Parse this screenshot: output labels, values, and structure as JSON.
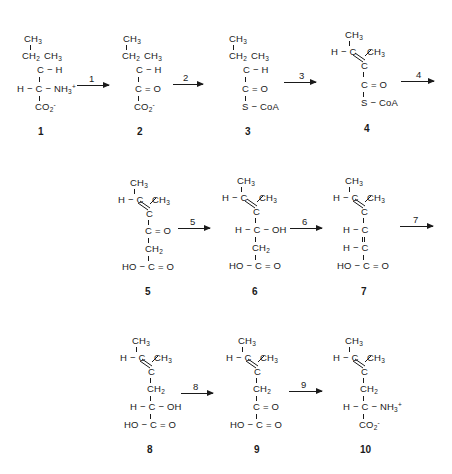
{
  "figure": {
    "type": "biochemical-pathway",
    "rows": 3,
    "compounds": [
      {
        "id": "1",
        "label": "1",
        "groups": [
          "CH3",
          "CH2",
          "CH3",
          "C-H",
          "H-C-NH3+",
          "CO2-"
        ]
      },
      {
        "id": "2",
        "label": "2",
        "groups": [
          "CH3",
          "CH2",
          "CH3",
          "C-H",
          "C=O",
          "CO2-"
        ]
      },
      {
        "id": "3",
        "label": "3",
        "groups": [
          "CH3",
          "CH2",
          "CH3",
          "C-H",
          "C=O",
          "S-CoA"
        ]
      },
      {
        "id": "4",
        "label": "4",
        "groups": [
          "CH3",
          "H-C",
          "CH3",
          "=C",
          "C=O",
          "S-CoA"
        ]
      },
      {
        "id": "5",
        "label": "5",
        "groups": [
          "CH3",
          "H-C",
          "CH3",
          "=C",
          "C=O",
          "CH2",
          "HO-C=O"
        ]
      },
      {
        "id": "6",
        "label": "6",
        "groups": [
          "CH3",
          "H-C",
          "CH3",
          "=C",
          "H-C-OH",
          "CH2",
          "HO-C=O"
        ]
      },
      {
        "id": "7",
        "label": "7",
        "groups": [
          "CH3",
          "H-C",
          "CH3",
          "=C",
          "H-C",
          "=",
          "H-C",
          "HO-C=O"
        ]
      },
      {
        "id": "8",
        "label": "8",
        "groups": [
          "CH3",
          "H-C",
          "CH3",
          "=C",
          "CH2",
          "H-C-OH",
          "HO-C=O"
        ]
      },
      {
        "id": "9",
        "label": "9",
        "groups": [
          "CH3",
          "H-C",
          "CH3",
          "=C",
          "CH2",
          "C=O",
          "HO-C=O"
        ]
      },
      {
        "id": "10",
        "label": "10",
        "groups": [
          "CH3",
          "H-C",
          "CH3",
          "=C",
          "CH2",
          "H-C-NH3+",
          "CO2-"
        ]
      }
    ],
    "arrows": [
      {
        "label": "1",
        "from": "1",
        "to": "2"
      },
      {
        "label": "2",
        "from": "2",
        "to": "3"
      },
      {
        "label": "3",
        "from": "3",
        "to": "4"
      },
      {
        "label": "4",
        "from": "4",
        "to": "5"
      },
      {
        "label": "5",
        "from": "5",
        "to": "6"
      },
      {
        "label": "6",
        "from": "6",
        "to": "7"
      },
      {
        "label": "7",
        "from": "7",
        "to": "8"
      },
      {
        "label": "8",
        "from": "8",
        "to": "9"
      },
      {
        "label": "9",
        "from": "9",
        "to": "10"
      }
    ],
    "text": {
      "CH3": "CH",
      "CH2": "CH",
      "sub3": "3",
      "sub2": "2",
      "C": "C",
      "H": "H",
      "O": "O",
      "OH": "OH",
      "HO": "HO",
      "NH3": "NH",
      "plus": "+",
      "minus": "-",
      "CO2": "CO",
      "SCoA": "S − CoA",
      "dash": "−",
      "eq": "=",
      "CeqO": "C = O",
      "HC": "H − C",
      "Cdash": "C − H",
      "HCdash": "H − C −",
      "HOCeqO": "HO − C = O",
      "HCOH": "H − C − OH",
      "HCNH3": "H − C − NH"
    }
  }
}
